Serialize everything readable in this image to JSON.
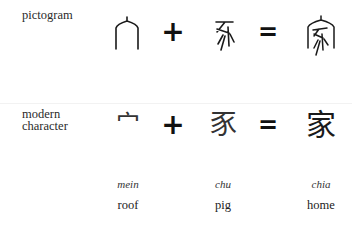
{
  "rows": {
    "pictogram": {
      "label": "pictogram"
    },
    "modern": {
      "label_line1": "modern",
      "label_line2": "character"
    }
  },
  "operators": {
    "plus": "+",
    "equals": "="
  },
  "components": [
    {
      "name": "roof",
      "modern_char": "宀",
      "romanization": "mein",
      "meaning": "roof",
      "pictogram_icon": "roof-pictogram-icon"
    },
    {
      "name": "pig",
      "modern_char": "豕",
      "romanization": "chu",
      "meaning": "pig",
      "pictogram_icon": "pig-pictogram-icon"
    },
    {
      "name": "home",
      "modern_char": "家",
      "romanization": "chia",
      "meaning": "home",
      "pictogram_icon": "home-pictogram-icon"
    }
  ],
  "colors": {
    "ink": "#1a1a1a",
    "background": "#ffffff"
  }
}
